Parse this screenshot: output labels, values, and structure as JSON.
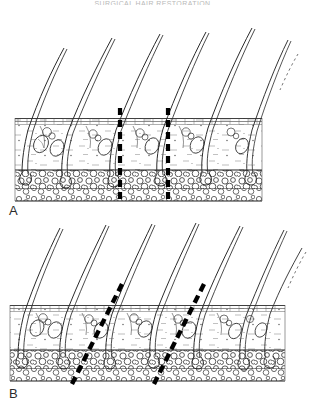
{
  "page": {
    "running_head": "SURGICAL HAIR RESTORATION",
    "background_color": "#ffffff",
    "ink_color": "#1a1a1a"
  },
  "figure": {
    "caption_letters": [
      "A",
      "B"
    ],
    "panels": [
      {
        "letter": "A",
        "name": "vertical-incision-panel",
        "incision_orientation": "vertical",
        "incision_angle_deg": 0,
        "incision_count": 2,
        "incision_x": [
          120,
          168
        ],
        "hair_count": 5,
        "partial_hair_count": 1,
        "slab": {
          "left": 15,
          "right": 262,
          "top": 118,
          "fat_top": 160,
          "bottom": 190
        }
      },
      {
        "letter": "B",
        "name": "oblique-incision-panel",
        "incision_orientation": "oblique",
        "incision_angle_deg": 27,
        "incision_count": 2,
        "incision_x": [
          104,
          196
        ],
        "hair_count": 6,
        "partial_hair_count": 1,
        "slab": {
          "left": 10,
          "right": 285,
          "top": 305,
          "fat_top": 350,
          "bottom": 382
        }
      }
    ],
    "layers": [
      {
        "name": "epidermis",
        "label": "epidermis"
      },
      {
        "name": "dermis",
        "label": "dermis"
      },
      {
        "name": "subcutaneous-fat",
        "label": "subcutaneous fat"
      },
      {
        "name": "galea",
        "label": "galea"
      }
    ],
    "structures": [
      {
        "name": "hair-shaft",
        "label": "hair shaft"
      },
      {
        "name": "hair-follicle",
        "label": "hair follicle"
      },
      {
        "name": "follicular-bulb",
        "label": "follicular bulb"
      },
      {
        "name": "sebaceous-gland",
        "label": "sebaceous gland"
      },
      {
        "name": "incision-line",
        "label": "incision line"
      }
    ]
  }
}
